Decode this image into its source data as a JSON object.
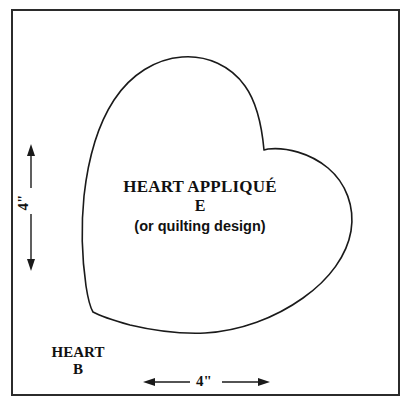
{
  "page": {
    "background_color": "#ffffff",
    "ink_color": "#2b2b2b",
    "width": 416,
    "height": 405
  },
  "block": {
    "name": "quilt-block-outline",
    "shape": "square",
    "border_color": "#2b2b2b"
  },
  "heart": {
    "shape": "heart-outline",
    "stroke_color": "#1a1a1a",
    "label": {
      "title": "HEART APPLIQUÉ",
      "letter": "E",
      "subtitle": "(or quilting design)"
    }
  },
  "piece": {
    "name_line1": "HEART",
    "name_line2": "B"
  },
  "dimensions": {
    "vertical": {
      "label": "4\"",
      "orientation": "vertical",
      "arrow_style": "double-headed"
    },
    "horizontal": {
      "label": "4\"",
      "orientation": "horizontal",
      "arrow_style": "double-headed"
    }
  }
}
